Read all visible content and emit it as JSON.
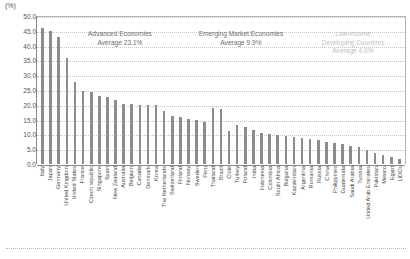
{
  "chart_data": {
    "type": "bar",
    "title": "",
    "xlabel": "",
    "ylabel": "(%)",
    "ylim": [
      0,
      50
    ],
    "ytick_step": 5,
    "yticks": [
      "0.0",
      "5.0",
      "10.0",
      "15.0",
      "20.0",
      "25.0",
      "30.0",
      "35.0",
      "40.0",
      "45.0",
      "50.0"
    ],
    "grid": true,
    "legend": "none",
    "bar_color": "#8c8c8c",
    "categories": [
      "Italy",
      "Japan",
      "Germany",
      "United Kingdom",
      "United States",
      "France",
      "Czech republic",
      "Singapore",
      "Spain",
      "New Zealand",
      "Australia",
      "Belgium",
      "Canada",
      "Denmark",
      "Korea",
      "The Netherlands",
      "Switzerland",
      "Finland",
      "Norway",
      "Sweden",
      "Peru",
      "Thailand",
      "Brazil",
      "Chile",
      "Turkey",
      "Poland",
      "India",
      "Indonesia",
      "Colombia",
      "South Africa",
      "Bulgaria",
      "Kazakhstan",
      "Argentina",
      "Romania",
      "Russia",
      "China",
      "Philippines",
      "Guatemala",
      "Saudi Arabia",
      "Tunisia",
      "United Arab Emirates",
      "Pakistan",
      "Mexico",
      "Egypt",
      "LIDCs"
    ],
    "values": [
      46.0,
      45.0,
      42.8,
      35.8,
      27.8,
      24.6,
      24.4,
      23.0,
      22.8,
      21.5,
      20.2,
      20.2,
      20.1,
      20.0,
      19.8,
      18.0,
      16.2,
      15.8,
      15.2,
      14.8,
      14.2,
      19.0,
      18.6,
      11.2,
      13.2,
      12.6,
      11.4,
      10.4,
      10.2,
      9.8,
      9.5,
      9.2,
      8.8,
      8.4,
      8.0,
      7.6,
      7.0,
      6.6,
      6.2,
      5.6,
      4.6,
      3.6,
      3.0,
      2.4,
      1.6
    ],
    "annotations": [
      {
        "id": "advanced-economies",
        "line1": "Advanced Economies",
        "line2": "Average 23.1%",
        "faint": false
      },
      {
        "id": "emerging-market-economies",
        "line1": "Emerging Market Economies",
        "line2": "Average 9.9%",
        "faint": false
      },
      {
        "id": "low-income-developing-countries",
        "line1": "Low-income",
        "line2": "Developing Countries",
        "line3": "Average 4.0%",
        "faint": true
      }
    ]
  }
}
